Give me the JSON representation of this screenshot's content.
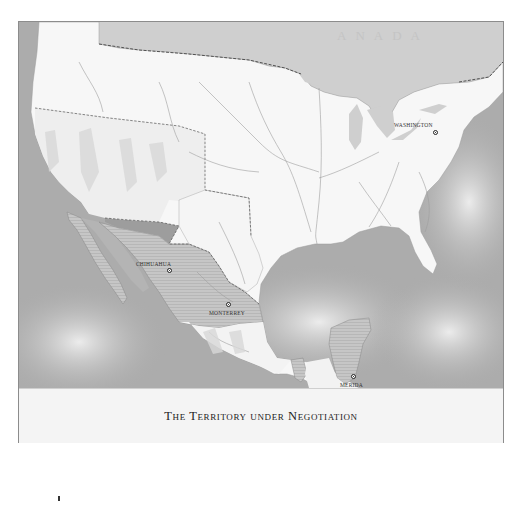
{
  "map": {
    "title": "The Territory under Negotiation",
    "country_labels": [
      {
        "name": "CANADA",
        "display": "ANADA"
      }
    ],
    "cities": [
      {
        "name": "WASHINGTON",
        "label": "WASHINGTON",
        "type": "capital"
      },
      {
        "name": "CHIHUAHUA",
        "label": "CHIHUAHUA",
        "type": "city"
      },
      {
        "name": "MONTERREY",
        "label": "MONTERREY",
        "type": "city"
      },
      {
        "name": "MEXICO",
        "label": "MEXICO",
        "type": "capital"
      },
      {
        "name": "MERIDA",
        "label": "MERIDA",
        "type": "city"
      }
    ],
    "legend": {
      "hatched_region": "Territory under negotiation (northern Mexico, Baja California, Yucatán, Tabasco)"
    },
    "colors": {
      "ocean": "#a9a9a9",
      "land": "#f7f7f7",
      "territory_hatch": "#bdbdbd",
      "border_line": "#555555",
      "river": "#9a9a9a",
      "caption_bg": "#f4f4f4"
    }
  }
}
